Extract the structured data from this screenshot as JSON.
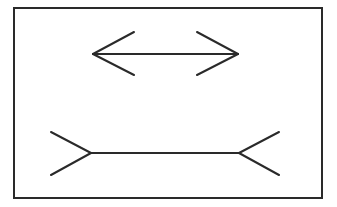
{
  "figure": {
    "name": "Muller-Lyer illusion",
    "background": "#ffffff",
    "stroke": "#2a2a2a",
    "frame": {
      "x": 14,
      "y": 8,
      "width": 308,
      "height": 190,
      "stroke_width": 2
    },
    "top_line": {
      "style": "arrowheads-outward",
      "shaft": {
        "x1": 93,
        "y1": 54,
        "x2": 238,
        "y2": 54
      },
      "fins": [
        {
          "x1": 93,
          "y1": 54,
          "x2": 134,
          "y2": 32
        },
        {
          "x1": 93,
          "y1": 54,
          "x2": 134,
          "y2": 75
        },
        {
          "x1": 238,
          "y1": 54,
          "x2": 197,
          "y2": 32
        },
        {
          "x1": 238,
          "y1": 54,
          "x2": 197,
          "y2": 75
        }
      ]
    },
    "bottom_line": {
      "style": "fins-inward",
      "shaft": {
        "x1": 91,
        "y1": 153,
        "x2": 239,
        "y2": 153
      },
      "fins": [
        {
          "x1": 91,
          "y1": 153,
          "x2": 51,
          "y2": 132
        },
        {
          "x1": 91,
          "y1": 153,
          "x2": 51,
          "y2": 175
        },
        {
          "x1": 239,
          "y1": 153,
          "x2": 279,
          "y2": 132
        },
        {
          "x1": 239,
          "y1": 153,
          "x2": 279,
          "y2": 175
        }
      ]
    }
  }
}
